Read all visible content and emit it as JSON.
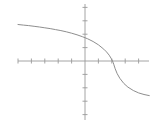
{
  "figure": {
    "title": "",
    "background_color": "#ffffff",
    "width": 154,
    "height": 123
  },
  "chart_data": {
    "type": "line",
    "title": "",
    "subtitle": "",
    "xlabel": "",
    "ylabel": "",
    "grid": false,
    "legend": null,
    "legend_position": "none",
    "annotations": [],
    "axes": {
      "x_axis": {
        "name": "x-axis",
        "color": "#9a9a9a",
        "pixel_y": 61,
        "pixel_x_start": 18,
        "pixel_x_end": 149,
        "origin_pixel_x": 85,
        "tick_spacing_px": 13.4,
        "tick_count": 10,
        "tick_length_px": 5,
        "range": [
          -5,
          4.8
        ],
        "tick_labels": []
      },
      "y_axis": {
        "name": "y-axis",
        "color": "#9a9a9a",
        "pixel_x": 85,
        "pixel_y_start": 4,
        "pixel_y_end": 120,
        "origin_pixel_y": 61,
        "tick_spacing_px": 13.4,
        "tick_count": 9,
        "tick_length_px": 5,
        "range": [
          -4.4,
          4.25
        ],
        "tick_labels": []
      }
    },
    "series": [
      {
        "name": "decreasing-sigmoid-curve",
        "color": "#8e8e8e",
        "line_width": 1,
        "description": "monotonically decreasing S-shaped curve with steep drop near x = 2.1",
        "x": [
          -5.0,
          -4.6,
          -4.2,
          -3.8,
          -3.4,
          -3.0,
          -2.6,
          -2.2,
          -1.8,
          -1.4,
          -1.0,
          -0.6,
          -0.2,
          0.2,
          0.6,
          1.0,
          1.4,
          1.6,
          1.8,
          1.95,
          2.05,
          2.1,
          2.15,
          2.25,
          2.4,
          2.6,
          2.9,
          3.2,
          3.6,
          4.0,
          4.4,
          4.8
        ],
        "y": [
          2.76,
          2.72,
          2.68,
          2.63,
          2.58,
          2.52,
          2.46,
          2.39,
          2.31,
          2.22,
          2.12,
          2.0,
          1.86,
          1.7,
          1.5,
          1.25,
          0.92,
          0.72,
          0.48,
          0.25,
          0.0,
          -0.12,
          -0.28,
          -0.58,
          -0.95,
          -1.3,
          -1.68,
          -1.95,
          -2.2,
          -2.38,
          -2.5,
          -2.58
        ],
        "pixel_points": [
          [
            18,
            24.5
          ],
          [
            23.4,
            25.1
          ],
          [
            28.7,
            25.6
          ],
          [
            34.1,
            26.3
          ],
          [
            39.5,
            27.0
          ],
          [
            44.8,
            27.8
          ],
          [
            50.2,
            28.6
          ],
          [
            55.5,
            29.6
          ],
          [
            60.9,
            30.6
          ],
          [
            66.3,
            31.8
          ],
          [
            71.6,
            33.2
          ],
          [
            77.0,
            34.8
          ],
          [
            82.4,
            36.7
          ],
          [
            87.7,
            38.8
          ],
          [
            93.1,
            41.5
          ],
          [
            98.4,
            44.8
          ],
          [
            103.8,
            49.2
          ],
          [
            106.5,
            51.9
          ],
          [
            109.2,
            55.2
          ],
          [
            111.1,
            58.3
          ],
          [
            112.5,
            61.0
          ],
          [
            113.2,
            62.6
          ],
          [
            113.9,
            64.8
          ],
          [
            115.2,
            68.8
          ],
          [
            117.2,
            73.7
          ],
          [
            119.9,
            78.4
          ],
          [
            123.9,
            83.5
          ],
          [
            127.9,
            87.1
          ],
          [
            133.3,
            90.5
          ],
          [
            138.6,
            92.9
          ],
          [
            144.0,
            94.5
          ],
          [
            149.3,
            95.6
          ]
        ]
      }
    ]
  }
}
